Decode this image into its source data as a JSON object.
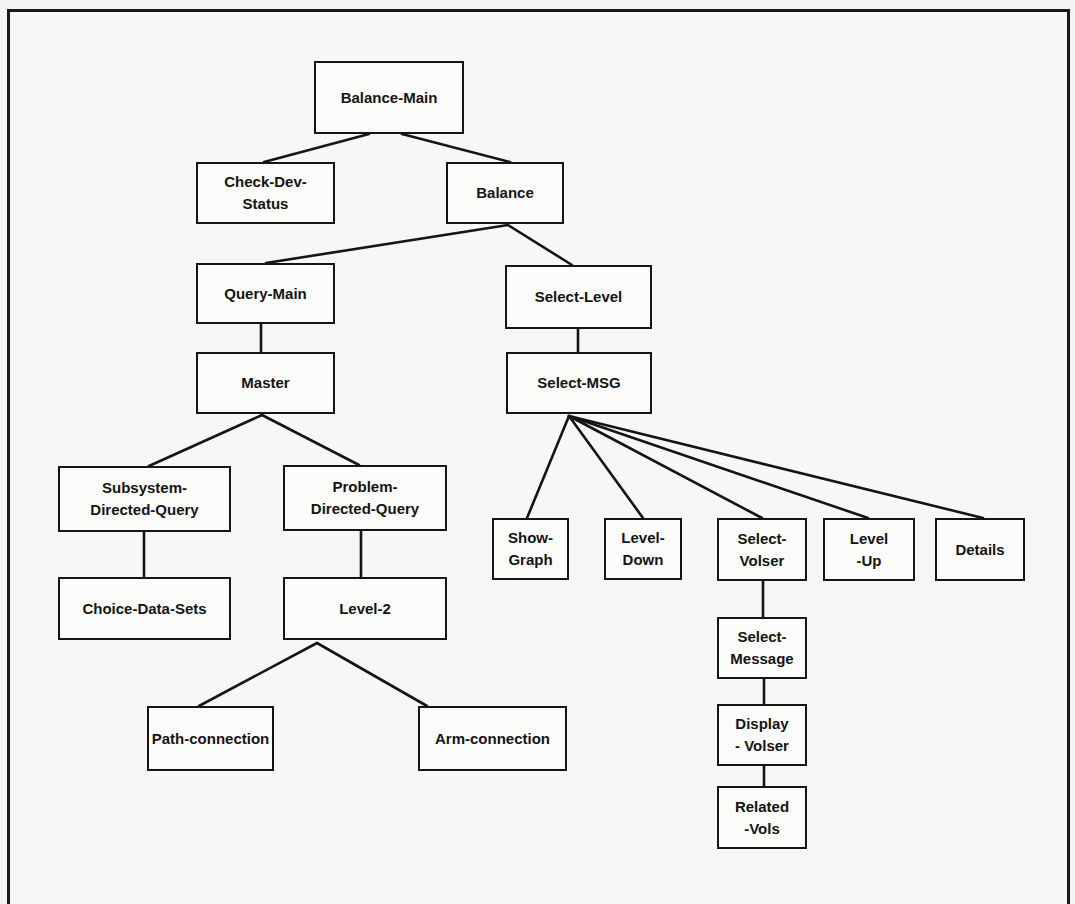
{
  "diagram": {
    "type": "hierarchy-tree",
    "colors": {
      "line": "#151515",
      "text": "#141414",
      "background": "#f7f7f5"
    },
    "nodes": [
      {
        "id": "balance-main",
        "label": "Balance-Main",
        "x": 314,
        "y": 61,
        "w": 150,
        "h": 73
      },
      {
        "id": "check-dev-status",
        "label": "Check-Dev-\nStatus",
        "x": 196,
        "y": 162,
        "w": 139,
        "h": 62
      },
      {
        "id": "balance",
        "label": "Balance",
        "x": 446,
        "y": 162,
        "w": 118,
        "h": 62
      },
      {
        "id": "query-main",
        "label": "Query-Main",
        "x": 196,
        "y": 263,
        "w": 139,
        "h": 61
      },
      {
        "id": "select-level",
        "label": "Select-Level",
        "x": 505,
        "y": 265,
        "w": 147,
        "h": 64
      },
      {
        "id": "master",
        "label": "Master",
        "x": 196,
        "y": 352,
        "w": 139,
        "h": 62
      },
      {
        "id": "select-msg",
        "label": "Select-MSG",
        "x": 506,
        "y": 352,
        "w": 146,
        "h": 62
      },
      {
        "id": "subsystem-directed-query",
        "label": "Subsystem-\nDirected-Query",
        "x": 58,
        "y": 466,
        "w": 173,
        "h": 66
      },
      {
        "id": "problem-directed-query",
        "label": "Problem-\nDirected-Query",
        "x": 283,
        "y": 465,
        "w": 164,
        "h": 66
      },
      {
        "id": "choice-data-sets",
        "label": "Choice-Data-Sets",
        "x": 58,
        "y": 577,
        "w": 173,
        "h": 63
      },
      {
        "id": "level-2",
        "label": "Level-2",
        "x": 283,
        "y": 577,
        "w": 164,
        "h": 63
      },
      {
        "id": "path-connection",
        "label": "Path-connection",
        "x": 147,
        "y": 706,
        "w": 127,
        "h": 65
      },
      {
        "id": "arm-connection",
        "label": "Arm-connection",
        "x": 418,
        "y": 706,
        "w": 149,
        "h": 65
      },
      {
        "id": "show-graph",
        "label": "Show-\nGraph",
        "x": 492,
        "y": 518,
        "w": 77,
        "h": 62
      },
      {
        "id": "level-down",
        "label": "Level-\nDown",
        "x": 604,
        "y": 518,
        "w": 78,
        "h": 62
      },
      {
        "id": "select-volser",
        "label": "Select-\nVolser",
        "x": 717,
        "y": 518,
        "w": 90,
        "h": 63
      },
      {
        "id": "level-up",
        "label": "Level\n-Up",
        "x": 823,
        "y": 518,
        "w": 92,
        "h": 63
      },
      {
        "id": "details",
        "label": "Details",
        "x": 935,
        "y": 518,
        "w": 90,
        "h": 63
      },
      {
        "id": "select-message",
        "label": "Select-\nMessage",
        "x": 717,
        "y": 617,
        "w": 90,
        "h": 62
      },
      {
        "id": "display-volser",
        "label": "Display\n-   Volser",
        "x": 717,
        "y": 704,
        "w": 90,
        "h": 62
      },
      {
        "id": "related-vols",
        "label": "Related\n-Vols",
        "x": 717,
        "y": 786,
        "w": 90,
        "h": 63
      }
    ],
    "edges": [
      {
        "from": "balance-main",
        "to": "check-dev-status",
        "x1": 369,
        "y1": 134,
        "x2": 264,
        "y2": 162
      },
      {
        "from": "balance-main",
        "to": "balance",
        "x1": 402,
        "y1": 134,
        "x2": 510,
        "y2": 162
      },
      {
        "from": "balance",
        "to": "query-main",
        "x1": 508,
        "y1": 225,
        "x2": 266,
        "y2": 263
      },
      {
        "from": "balance",
        "to": "select-level",
        "x1": 508,
        "y1": 225,
        "x2": 572,
        "y2": 265
      },
      {
        "from": "query-main",
        "to": "master",
        "x1": 261,
        "y1": 324,
        "x2": 261,
        "y2": 352
      },
      {
        "from": "select-level",
        "to": "select-msg",
        "x1": 578,
        "y1": 329,
        "x2": 578,
        "y2": 352
      },
      {
        "from": "master",
        "to": "subsystem-directed-query",
        "x1": 262,
        "y1": 415,
        "x2": 149,
        "y2": 466
      },
      {
        "from": "master",
        "to": "problem-directed-query",
        "x1": 262,
        "y1": 415,
        "x2": 359,
        "y2": 465
      },
      {
        "from": "subsystem-directed-query",
        "to": "choice-data-sets",
        "x1": 144,
        "y1": 532,
        "x2": 144,
        "y2": 577
      },
      {
        "from": "problem-directed-query",
        "to": "level-2",
        "x1": 361,
        "y1": 531,
        "x2": 361,
        "y2": 577
      },
      {
        "from": "level-2",
        "to": "path-connection",
        "x1": 317,
        "y1": 643,
        "x2": 199,
        "y2": 706
      },
      {
        "from": "level-2",
        "to": "arm-connection",
        "x1": 317,
        "y1": 643,
        "x2": 427,
        "y2": 706
      },
      {
        "from": "select-msg",
        "to": "show-graph",
        "x1": 569,
        "y1": 416,
        "x2": 527,
        "y2": 518
      },
      {
        "from": "select-msg",
        "to": "level-down",
        "x1": 569,
        "y1": 416,
        "x2": 643,
        "y2": 518
      },
      {
        "from": "select-msg",
        "to": "select-volser",
        "x1": 569,
        "y1": 416,
        "x2": 762,
        "y2": 518
      },
      {
        "from": "select-msg",
        "to": "level-up",
        "x1": 569,
        "y1": 416,
        "x2": 868,
        "y2": 518
      },
      {
        "from": "select-msg",
        "to": "details",
        "x1": 569,
        "y1": 416,
        "x2": 983,
        "y2": 518
      },
      {
        "from": "select-volser",
        "to": "select-message",
        "x1": 763,
        "y1": 581,
        "x2": 763,
        "y2": 617
      },
      {
        "from": "select-message",
        "to": "display-volser",
        "x1": 764,
        "y1": 679,
        "x2": 764,
        "y2": 704
      },
      {
        "from": "display-volser",
        "to": "related-vols",
        "x1": 764,
        "y1": 766,
        "x2": 764,
        "y2": 786
      }
    ]
  }
}
